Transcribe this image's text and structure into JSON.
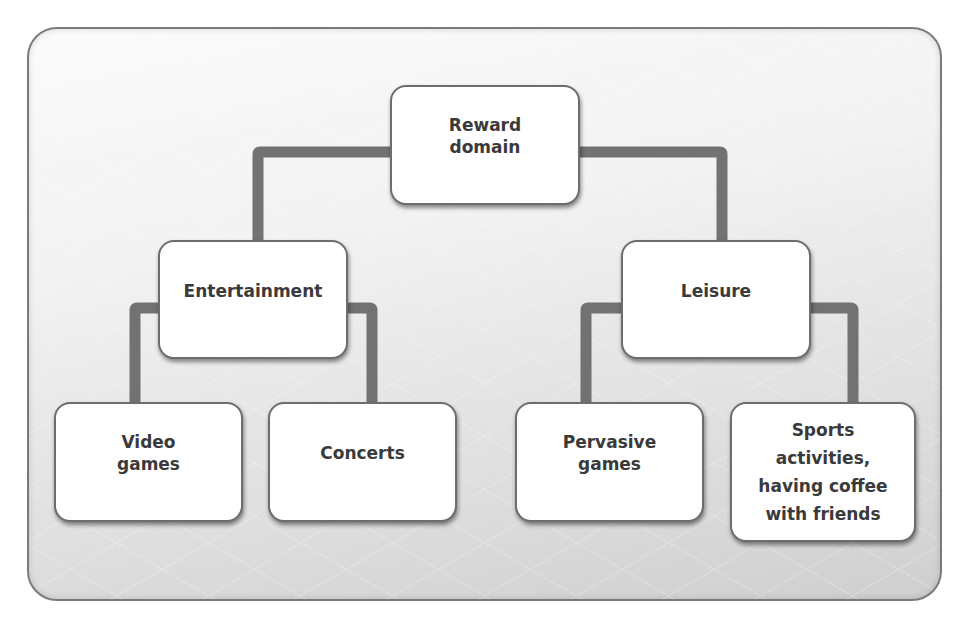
{
  "diagram": {
    "type": "hierarchy-tree",
    "connector_color": "#727272",
    "node_border_color": "#6d6d6d",
    "text_color": "#3a3a3a",
    "root": {
      "label": "Reward\ndomain"
    },
    "level1": [
      {
        "label": "Entertainment"
      },
      {
        "label": "Leisure"
      }
    ],
    "level2": [
      {
        "label": "Video\ngames",
        "parent": "Entertainment"
      },
      {
        "label": "Concerts",
        "parent": "Entertainment"
      },
      {
        "label": "Pervasive\ngames",
        "parent": "Leisure"
      },
      {
        "label": "Sports\nactivities,\nhaving coffee\nwith friends",
        "parent": "Leisure"
      }
    ]
  }
}
